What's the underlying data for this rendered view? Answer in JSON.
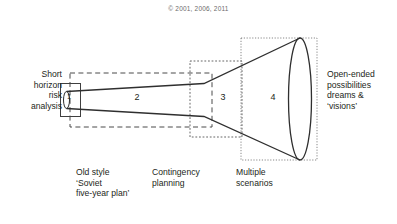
{
  "copyright": "© 2001, 2006, 2011",
  "diagram": {
    "title_type": "futures-cone",
    "left_label": "Short\nhorizon\nrisk\nanalysis",
    "right_label": "Open-ended\npossibilities\ndreams &\n‘visions’",
    "zones": [
      {
        "number": "1",
        "caption": "",
        "border_style": "solid",
        "accent": "#3f3f3f"
      },
      {
        "number": "2",
        "caption": "Old style\n‘Soviet\nfive-year plan’",
        "border_style": "dashed",
        "accent": "#4a4a4a"
      },
      {
        "number": "3",
        "caption": "Contingency\nplanning",
        "border_style": "dotted",
        "accent": "#565656"
      },
      {
        "number": "4",
        "caption": "Multiple\nscenarios",
        "border_style": "fine-dotted",
        "accent": "#6a6a6a"
      }
    ],
    "colors": {
      "cone_stroke": "#2f2f2f",
      "box_stroke": "#4d4d4d",
      "text": "#231f20",
      "copyright_text": "#6d6b6c",
      "background": "#ffffff"
    }
  }
}
